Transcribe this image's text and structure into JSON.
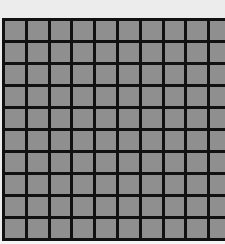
{
  "grid": {
    "rows": 10,
    "cols": 10,
    "colors": {
      "background": "#ececec",
      "line": "#111111",
      "cell": "#8f8f8f"
    }
  }
}
